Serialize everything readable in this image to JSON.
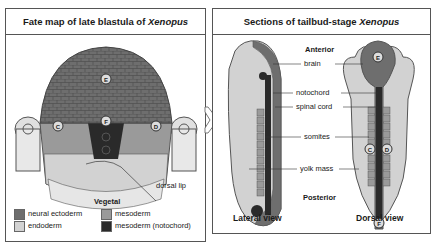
{
  "left_panel": {
    "title_prefix": "Fate map of late blastula of ",
    "title_species": "Xenopus",
    "pole_top": "Animal",
    "pole_bottom": "Vegetal",
    "annotation": "dorsal lip",
    "markers": [
      "E",
      "F",
      "C",
      "D"
    ],
    "legend": [
      {
        "label": "neural ectoderm",
        "color": "#6e6e6e"
      },
      {
        "label": "endoderm",
        "color": "#d2d2d2"
      },
      {
        "label": "mesoderm",
        "color": "#9a9a9a"
      },
      {
        "label": "mesoderm (notochord)",
        "color": "#2a2a2a"
      }
    ]
  },
  "right_panel": {
    "title_prefix": "Sections of tailbud-stage ",
    "title_species": "Xenopus",
    "axis_top": "Anterior",
    "axis_bottom": "Posterior",
    "labels": [
      "brain",
      "notochord",
      "spinal cord",
      "somites",
      "yolk mass"
    ],
    "views": [
      "Lateral view",
      "Dorsal view"
    ],
    "markers": [
      "E",
      "C",
      "D",
      "F"
    ]
  },
  "colors": {
    "neural": "#6e6e6e",
    "endoderm": "#d2d2d2",
    "mesoderm": "#9a9a9a",
    "notochord": "#2a2a2a",
    "border": "#555555"
  }
}
